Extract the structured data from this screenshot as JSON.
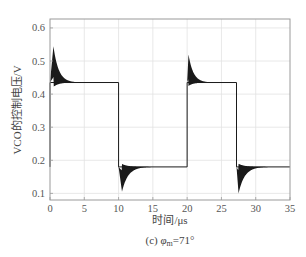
{
  "chart_data": {
    "type": "line",
    "title": "",
    "caption": "(c) φm=71°",
    "caption_prefix": "(c) ",
    "caption_symbol": "φ",
    "caption_subscript": "m",
    "caption_suffix": "=71°",
    "xlabel": "时间/μs",
    "ylabel": "VCO的控制电压/V",
    "xlim": [
      0,
      35
    ],
    "ylim": [
      0.08,
      0.627
    ],
    "xticks": [
      0,
      5,
      10,
      15,
      20,
      25,
      30,
      35
    ],
    "xtick_labels": [
      "0",
      "5",
      "10",
      "15",
      "20",
      "25",
      "30",
      "35"
    ],
    "yticks": [
      0.1,
      0.2,
      0.3,
      0.4,
      0.5,
      0.6
    ],
    "ytick_labels": [
      "0.1",
      "0.2",
      "0.3",
      "0.4",
      "0.5",
      "0.6"
    ],
    "grid": true,
    "legend": null,
    "series": [
      {
        "name": "VCO control voltage",
        "color": "#1a1a1a",
        "description": "Square-wave-like response with damped high-frequency ringing after each transition",
        "high_level": 0.435,
        "low_level": 0.18,
        "transitions": [
          {
            "t": 0.0,
            "from": 0.18,
            "to": 0.435,
            "overshoot_peak": 0.545,
            "peak_time": 0.5,
            "settle_time": 3.5
          },
          {
            "t": 10.0,
            "from": 0.435,
            "to": 0.18,
            "undershoot_min": 0.105,
            "min_time": 10.5,
            "settle_time": 14.0
          },
          {
            "t": 20.0,
            "from": 0.18,
            "to": 0.435,
            "overshoot_peak": 0.52,
            "peak_time": 20.2,
            "settle_time": 23.0
          },
          {
            "t": 27.2,
            "from": 0.435,
            "to": 0.18,
            "undershoot_min": 0.1,
            "min_time": 27.5,
            "settle_time": 31.0
          }
        ],
        "x": [
          0,
          0.5,
          1,
          2,
          3,
          5,
          9.9,
          10,
          10.5,
          11,
          12,
          14,
          19.9,
          20,
          20.2,
          21,
          22,
          23,
          27.1,
          27.2,
          27.5,
          28,
          29,
          31,
          35
        ],
        "y": [
          0.18,
          0.545,
          0.48,
          0.445,
          0.437,
          0.435,
          0.435,
          0.435,
          0.105,
          0.15,
          0.172,
          0.18,
          0.18,
          0.18,
          0.52,
          0.46,
          0.44,
          0.436,
          0.435,
          0.435,
          0.1,
          0.15,
          0.172,
          0.18,
          0.18
        ]
      }
    ]
  }
}
